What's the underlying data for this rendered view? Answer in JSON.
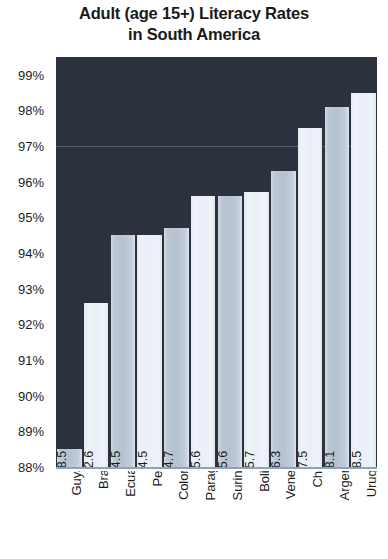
{
  "chart_data": {
    "type": "bar",
    "title": "Adult (age 15+) Literacy Rates in South America",
    "title_lines": [
      "Adult (age 15+) Literacy Rates",
      "in South America"
    ],
    "xlabel": "",
    "ylabel": "",
    "ylim": [
      88,
      99.5
    ],
    "grid": true,
    "legend": "none",
    "categories": [
      "Guyana",
      "Brazil",
      "Ecuador",
      "Peru",
      "Colombia",
      "Paraguay",
      "Suriname",
      "Bolivia",
      "Venezuel",
      "Chile",
      "Argentina",
      "Uruguay"
    ],
    "values": [
      88.5,
      92.6,
      94.5,
      94.5,
      94.7,
      95.6,
      95.6,
      95.7,
      96.3,
      97.5,
      98.1,
      98.5
    ],
    "value_labels": [
      "88.5",
      "92.6",
      "94.5",
      "94.5",
      "94.7",
      "95.6",
      "95.6",
      "95.7",
      "96.3",
      "97.5",
      "98.1",
      "98.5"
    ],
    "ytick_values": [
      88,
      89,
      90,
      91,
      92,
      93,
      94,
      95,
      96,
      97,
      98,
      99
    ],
    "ytick_labels": [
      "88%",
      "89%",
      "90%",
      "91%",
      "92%",
      "93%",
      "94%",
      "95%",
      "96%",
      "97%",
      "98%",
      "99%"
    ],
    "gridline_values": [
      97
    ],
    "colors": {
      "plot_background": "#2b323e",
      "bar_tone_a": "#b6c2d0",
      "bar_tone_b": "#e9eff5",
      "gridline": "#5c6472",
      "axis_line": "#8fa2b8",
      "text": "#1c1c1c",
      "title": "#1a1a1a",
      "figure_background": "#ffffff"
    }
  }
}
